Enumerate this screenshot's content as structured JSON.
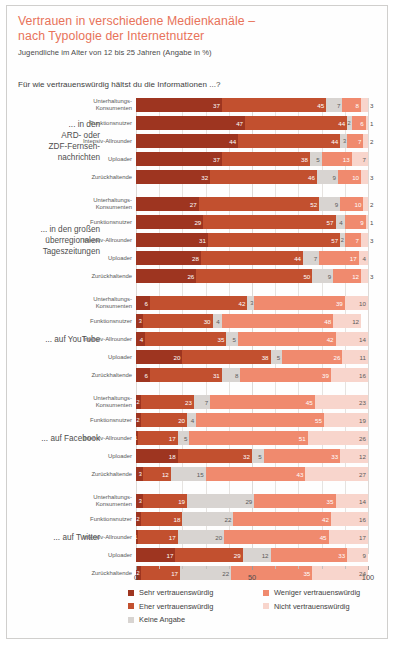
{
  "header": {
    "title_line1": "Vertrauen in verschiedene Medienkanäle –",
    "title_line2": "nach Typologie der Internetnutzer",
    "subtitle": "Jugendliche im Alter von 12 bis 25 Jahren (Angabe in %)",
    "question": "Für wie vertrauenswürdig hältst du die Informationen ...?",
    "title_color": "#e8735a"
  },
  "legend": {
    "position": "bottom",
    "column1": [
      {
        "label": "Sehr vertrauenswürdig",
        "color": "#9e3520"
      },
      {
        "label": "Eher vertrauenswürdig",
        "color": "#c2502f"
      },
      {
        "label": "Keine Angabe",
        "color": "#d8d4d1"
      }
    ],
    "column2": [
      {
        "label": "Weniger vertrauenswürdig",
        "color": "#f08a6e"
      },
      {
        "label": "Nicht vertrauenswürdig",
        "color": "#f8d5cc"
      }
    ]
  },
  "axis": {
    "ticks": [
      "0",
      "50",
      "100"
    ],
    "min": 0,
    "max": 100
  },
  "chart_data": {
    "type": "bar",
    "orientation": "horizontal",
    "stacked": true,
    "title": "Vertrauen in verschiedene Medienkanäle – nach Typologie der Internetnutzer",
    "subtitle": "Jugendliche im Alter von 12 bis 25 Jahren (Angabe in %)",
    "xlabel": "",
    "ylabel": "",
    "xlim": [
      0,
      100
    ],
    "grid": true,
    "legend_position": "bottom",
    "series_names": [
      "Sehr vertrauenswürdig",
      "Eher vertrauenswürdig",
      "Keine Angabe",
      "Weniger vertrauenswürdig",
      "Nicht vertrauenswürdig"
    ],
    "series_colors": [
      "#9e3520",
      "#c2502f",
      "#d8d4d1",
      "#f08a6e",
      "#f8d5cc"
    ],
    "categories": [
      "Unterhaltungs-Konsumenten",
      "Funktionsnutzer",
      "Intensiv-Allrounder",
      "Uploader",
      "Zurückhaltende"
    ],
    "groups": [
      {
        "label": "... in den ARD- oder ZDF-Fernseh-nachrichten",
        "label_lines": [
          "... in den",
          "ARD- oder",
          "ZDF-Fernseh-",
          "nachrichten"
        ],
        "rows": [
          {
            "category": "Unterhaltungs-Konsumenten",
            "label_lines": [
              "Unterhaltungs-",
              "Konsumenten"
            ],
            "values": [
              37,
              45,
              7,
              8,
              3
            ]
          },
          {
            "category": "Funktionsnutzer",
            "label_lines": [
              "Funktionsnutzer"
            ],
            "values": [
              47,
              44,
              2,
              6,
              1
            ]
          },
          {
            "category": "Intensiv-Allrounder",
            "label_lines": [
              "Intensiv-Allrounder"
            ],
            "values": [
              44,
              44,
              3,
              7,
              2
            ]
          },
          {
            "category": "Uploader",
            "label_lines": [
              "Uploader"
            ],
            "values": [
              37,
              38,
              5,
              13,
              7
            ]
          },
          {
            "category": "Zurückhaltende",
            "label_lines": [
              "Zurückhaltende"
            ],
            "values": [
              32,
              46,
              9,
              10,
              3
            ]
          }
        ]
      },
      {
        "label": "... in den großen überregionalen Tageszeitungen",
        "label_lines": [
          "... in den großen",
          "überregionalen",
          "Tageszeitungen"
        ],
        "rows": [
          {
            "category": "Unterhaltungs-Konsumenten",
            "label_lines": [
              "Unterhaltungs-",
              "Konsumenten"
            ],
            "values": [
              27,
              52,
              9,
              10,
              2
            ]
          },
          {
            "category": "Funktionsnutzer",
            "label_lines": [
              "Funktionsnutzer"
            ],
            "values": [
              29,
              57,
              4,
              9,
              1
            ]
          },
          {
            "category": "Intensiv-Allrounder",
            "label_lines": [
              "Intensiv-Allrounder"
            ],
            "values": [
              31,
              57,
              2,
              7,
              3
            ]
          },
          {
            "category": "Uploader",
            "label_lines": [
              "Uploader"
            ],
            "values": [
              28,
              44,
              7,
              17,
              4
            ]
          },
          {
            "category": "Zurückhaltende",
            "label_lines": [
              "Zurückhaltende"
            ],
            "values": [
              26,
              50,
              9,
              12,
              3
            ]
          }
        ]
      },
      {
        "label": "... auf YouTube",
        "label_lines": [
          "... auf YouTube"
        ],
        "rows": [
          {
            "category": "Unterhaltungs-Konsumenten",
            "label_lines": [
              "Unterhaltungs-",
              "Konsumenten"
            ],
            "values": [
              6,
              42,
              3,
              39,
              10
            ]
          },
          {
            "category": "Funktionsnutzer",
            "label_lines": [
              "Funktionsnutzer"
            ],
            "values": [
              3,
              30,
              4,
              48,
              12
            ]
          },
          {
            "category": "Intensiv-Allrounder",
            "label_lines": [
              "Intensiv-Allrounder"
            ],
            "values": [
              4,
              35,
              5,
              42,
              14
            ]
          },
          {
            "category": "Uploader",
            "label_lines": [
              "Uploader"
            ],
            "values": [
              20,
              38,
              5,
              26,
              11
            ]
          },
          {
            "category": "Zurückhaltende",
            "label_lines": [
              "Zurückhaltende"
            ],
            "values": [
              6,
              31,
              8,
              39,
              16
            ]
          }
        ]
      },
      {
        "label": "... auf Facebook",
        "label_lines": [
          "... auf Facebook"
        ],
        "rows": [
          {
            "category": "Unterhaltungs-Konsumenten",
            "label_lines": [
              "Unterhaltungs-",
              "Konsumenten"
            ],
            "values": [
              2,
              23,
              7,
              45,
              23
            ]
          },
          {
            "category": "Funktionsnutzer",
            "label_lines": [
              "Funktionsnutzer"
            ],
            "values": [
              2,
              20,
              4,
              55,
              19
            ]
          },
          {
            "category": "Intensiv-Allrounder",
            "label_lines": [
              "Intensiv-Allrounder"
            ],
            "values": [
              1,
              17,
              5,
              51,
              26
            ]
          },
          {
            "category": "Uploader",
            "label_lines": [
              "Uploader"
            ],
            "values": [
              18,
              32,
              5,
              33,
              12
            ]
          },
          {
            "category": "Zurückhaltende",
            "label_lines": [
              "Zurückhaltende"
            ],
            "values": [
              3,
              12,
              15,
              43,
              27
            ]
          }
        ]
      },
      {
        "label": "... auf Twitter",
        "label_lines": [
          "... auf Twitter"
        ],
        "rows": [
          {
            "category": "Unterhaltungs-Konsumenten",
            "label_lines": [
              "Unterhaltungs-",
              "Konsumenten"
            ],
            "values": [
              3,
              19,
              29,
              35,
              14
            ]
          },
          {
            "category": "Funktionsnutzer",
            "label_lines": [
              "Funktionsnutzer"
            ],
            "values": [
              2,
              18,
              22,
              42,
              16
            ]
          },
          {
            "category": "Intensiv-Allrounder",
            "label_lines": [
              "Intensiv-Allrounder"
            ],
            "values": [
              1,
              17,
              20,
              45,
              17
            ]
          },
          {
            "category": "Uploader",
            "label_lines": [
              "Uploader"
            ],
            "values": [
              17,
              29,
              12,
              33,
              9
            ]
          },
          {
            "category": "Zurückhaltende",
            "label_lines": [
              "Zurückhaltende"
            ],
            "values": [
              2,
              17,
              22,
              35,
              24
            ]
          }
        ]
      }
    ]
  }
}
